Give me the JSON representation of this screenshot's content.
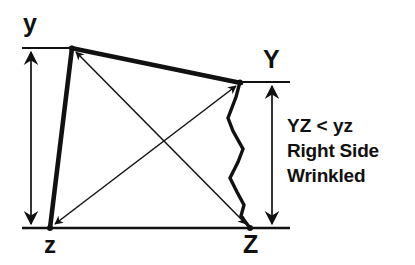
{
  "figure": {
    "type": "diagram",
    "background_color": "#ffffff",
    "line_color": "#111111",
    "width": 415,
    "height": 265
  },
  "vertices": {
    "y_lower": {
      "label": "y",
      "x": 72,
      "y": 48
    },
    "y_upper": {
      "label": "Y",
      "x": 240,
      "y": 82
    },
    "z_lower": {
      "label": "z",
      "x": 50,
      "y": 228
    },
    "z_upper": {
      "label": "Z",
      "x": 250,
      "y": 228
    }
  },
  "edges": [
    {
      "name": "top-edge-y-to-Y",
      "from": "y_lower",
      "to": "y_upper",
      "style": "thick",
      "arrow": "none"
    },
    {
      "name": "left-edge-y-to-z",
      "from": "y_lower",
      "to": "z_lower",
      "style": "thick",
      "arrow": "none"
    },
    {
      "name": "right-edge-Y-to-Z-wrinkled",
      "from": "y_upper",
      "to": "z_upper",
      "style": "wrinkled",
      "arrow": "none"
    },
    {
      "name": "baseline-z-to-Z",
      "from": "z_lower",
      "to": "z_upper",
      "style": "thin-rule",
      "arrow": "none"
    },
    {
      "name": "diagonal-y-to-Z",
      "from": "y_lower",
      "to": "z_upper",
      "style": "thin",
      "arrow": "both"
    },
    {
      "name": "diagonal-z-to-Y",
      "from": "z_lower",
      "to": "y_upper",
      "style": "thin",
      "arrow": "both"
    }
  ],
  "dimensions": [
    {
      "name": "yz-dimension",
      "label_top": "y",
      "label_bottom": "z",
      "x": 31,
      "y_top": 48,
      "y_bottom": 228,
      "arrow": "both"
    },
    {
      "name": "YZ-dimension",
      "label_top": "Y",
      "label_bottom": "Z",
      "x": 272,
      "y_top": 82,
      "y_bottom": 228,
      "arrow": "both"
    }
  ],
  "extension_lines": [
    {
      "name": "ext-line-y-top",
      "x1": 22,
      "y1": 48,
      "x2": 72,
      "y2": 48
    },
    {
      "name": "ext-line-Y-top",
      "x1": 238,
      "y1": 82,
      "x2": 290,
      "y2": 82
    },
    {
      "name": "ext-line-baseline",
      "x1": 22,
      "y1": 228,
      "x2": 290,
      "y2": 228
    }
  ],
  "wrinkle_path": {
    "name": "wrinkled-right-side",
    "points": [
      [
        240,
        82
      ],
      [
        236,
        97
      ],
      [
        228,
        118
      ],
      [
        233,
        131
      ],
      [
        243,
        149
      ],
      [
        238,
        162
      ],
      [
        230,
        178
      ],
      [
        237,
        192
      ],
      [
        244,
        205
      ],
      [
        241,
        216
      ],
      [
        250,
        228
      ]
    ]
  },
  "annotation": {
    "lines": [
      "YZ < yz",
      "Right Side",
      "Wrinkled"
    ],
    "line_1": "YZ < yz",
    "line_2": "Right Side",
    "line_3": "Wrinkled"
  }
}
